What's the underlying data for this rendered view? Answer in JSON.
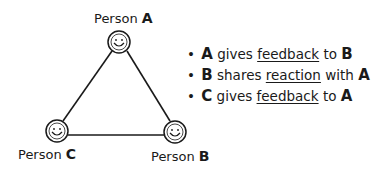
{
  "nodes": [
    {
      "id": "A",
      "prefix": "Person",
      "letter": "A"
    },
    {
      "id": "B",
      "prefix": "Person",
      "letter": "B"
    },
    {
      "id": "C",
      "prefix": "Person",
      "letter": "C"
    }
  ],
  "bullets": [
    {
      "subject": "A",
      "verb": "gives",
      "object": "feedback",
      "prep": "to",
      "target": "B"
    },
    {
      "subject": "B",
      "verb": "shares",
      "object": "reaction",
      "prep": "with",
      "target": "A"
    },
    {
      "subject": "C",
      "verb": "gives",
      "object": "feedback",
      "prep": "to",
      "target": "A"
    }
  ],
  "bullet_symbol": "•"
}
